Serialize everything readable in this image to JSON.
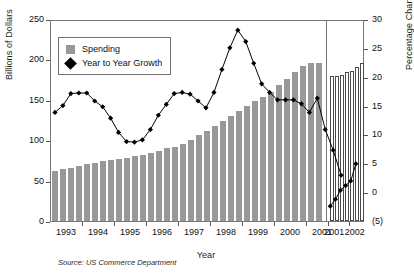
{
  "chart_data": {
    "type": "bar",
    "title": "",
    "xlabel": "Year",
    "ylabel": "Billions of Dollars",
    "y2label": "Percentage Change (%)",
    "ylim": [
      0,
      250
    ],
    "y2lim": [
      -5,
      30
    ],
    "grid": false,
    "legend_position": "upper-left-inside",
    "source": "Source: US Commerce Department",
    "y_ticks": [
      "0",
      "50",
      "100",
      "150",
      "200",
      "250"
    ],
    "y_tick_values": [
      0,
      50,
      100,
      150,
      200,
      250
    ],
    "y2_ticks": [
      "(5)",
      "0",
      "5",
      "10",
      "15",
      "20",
      "25",
      "30"
    ],
    "y2_tick_values": [
      -5,
      0,
      5,
      10,
      15,
      20,
      25,
      30
    ],
    "x_ticks_actual": [
      "1993",
      "1994",
      "1995",
      "1996",
      "1997",
      "1998",
      "1999",
      "2000",
      "2001"
    ],
    "x_ticks_forecast": [
      "2001",
      "2002"
    ],
    "legend": [
      {
        "label": "Spending",
        "marker": "square",
        "color": "#989898"
      },
      {
        "label": "Year to Year Growth",
        "marker": "diamond",
        "color": "#000000"
      }
    ],
    "series": [
      {
        "name": "Spending",
        "marker": "bar",
        "axis": "left",
        "unit": "Billions of Dollars",
        "segment": "actual",
        "periods": [
          "1993Q1",
          "1993Q2",
          "1993Q3",
          "1993Q4",
          "1994Q1",
          "1994Q2",
          "1994Q3",
          "1994Q4",
          "1995Q1",
          "1995Q2",
          "1995Q3",
          "1995Q4",
          "1996Q1",
          "1996Q2",
          "1996Q3",
          "1996Q4",
          "1997Q1",
          "1997Q2",
          "1997Q3",
          "1997Q4",
          "1998Q1",
          "1998Q2",
          "1998Q3",
          "1998Q4",
          "1999Q1",
          "1999Q2",
          "1999Q3",
          "1999Q4",
          "2000Q1",
          "2000Q2",
          "2000Q3",
          "2000Q4",
          "2001Q1",
          "2001Q2"
        ],
        "values": [
          62,
          64,
          66,
          68,
          70,
          72,
          74,
          76,
          77,
          78,
          80,
          82,
          84,
          87,
          90,
          92,
          95,
          100,
          106,
          112,
          118,
          124,
          130,
          136,
          142,
          148,
          154,
          160,
          168,
          176,
          184,
          192,
          196,
          196
        ]
      },
      {
        "name": "Spending",
        "marker": "bar",
        "axis": "left",
        "unit": "Billions of Dollars",
        "segment": "forecast",
        "periods": [
          "2001Q3",
          "2001Q4",
          "2002Q1",
          "2002Q2",
          "2002Q3",
          "2002Q4",
          "2003Q1"
        ],
        "values": [
          180,
          180,
          181,
          184,
          186,
          191,
          195
        ]
      },
      {
        "name": "Year to Year Growth",
        "marker": "diamond",
        "axis": "right",
        "unit": "Percentage Change (%)",
        "segment": "actual",
        "periods": [
          "1993Q1",
          "1993Q2",
          "1993Q3",
          "1993Q4",
          "1994Q1",
          "1994Q2",
          "1994Q3",
          "1994Q4",
          "1995Q1",
          "1995Q2",
          "1995Q3",
          "1995Q4",
          "1996Q1",
          "1996Q2",
          "1996Q3",
          "1996Q4",
          "1997Q1",
          "1997Q2",
          "1997Q3",
          "1997Q4",
          "1998Q1",
          "1998Q2",
          "1998Q3",
          "1998Q4",
          "1999Q1",
          "1999Q2",
          "1999Q3",
          "1999Q4",
          "2000Q1",
          "2000Q2",
          "2000Q3",
          "2000Q4",
          "2001Q1",
          "2001Q2"
        ],
        "values": [
          14.0,
          15.2,
          17.3,
          17.4,
          17.4,
          16.0,
          15.0,
          13.0,
          10.5,
          8.9,
          8.8,
          9.2,
          11.0,
          13.5,
          15.4,
          17.3,
          17.5,
          17.2,
          16.0,
          14.8,
          17.5,
          21.5,
          25.3,
          28.4,
          26.4,
          22.6,
          19.0,
          17.5,
          16.2,
          16.2,
          16.2,
          15.5,
          14.0,
          16.5
        ]
      },
      {
        "name": "Year to Year Growth",
        "marker": "diamond",
        "axis": "right",
        "unit": "Percentage Change (%)",
        "segment": "decline",
        "periods": [
          "2001Q3",
          "2001Q4",
          "2002Q1"
        ],
        "values": [
          11.0,
          7.4,
          3.0
        ]
      },
      {
        "name": "Year to Year Growth",
        "marker": "diamond",
        "axis": "right",
        "unit": "Percentage Change (%)",
        "segment": "forecast",
        "periods": [
          "2001Q3",
          "2001Q4",
          "2002Q1",
          "2002Q2",
          "2002Q3",
          "2002Q4"
        ],
        "values": [
          -2.4,
          -1.2,
          0.4,
          1.2,
          2.0,
          5.0
        ]
      }
    ]
  }
}
